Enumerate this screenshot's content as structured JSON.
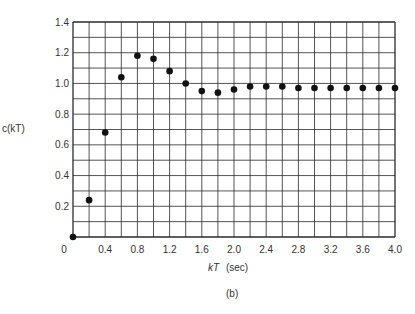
{
  "chart_data": {
    "type": "scatter",
    "title": "",
    "caption": "(b)",
    "xlabel": "kT (sec)",
    "xlabel_var": "kT",
    "xlabel_unit": "(sec)",
    "ylabel": "c(kT)",
    "xlim": [
      0,
      4.0
    ],
    "ylim": [
      0,
      1.4
    ],
    "grid": true,
    "grid_x_step": 0.2,
    "grid_y_step": 0.1,
    "x_ticks": [
      {
        "value": 0,
        "label": "0"
      },
      {
        "value": 0.4,
        "label": "0.4"
      },
      {
        "value": 0.8,
        "label": "0.8"
      },
      {
        "value": 1.2,
        "label": "1.2"
      },
      {
        "value": 1.6,
        "label": "1.6"
      },
      {
        "value": 2.0,
        "label": "2.0"
      },
      {
        "value": 2.4,
        "label": "2.4"
      },
      {
        "value": 2.8,
        "label": "2.8"
      },
      {
        "value": 3.2,
        "label": "3.2"
      },
      {
        "value": 3.6,
        "label": "3.6"
      },
      {
        "value": 4.0,
        "label": "4.0"
      }
    ],
    "y_ticks": [
      {
        "value": 0.2,
        "label": "0.2"
      },
      {
        "value": 0.4,
        "label": "0.4"
      },
      {
        "value": 0.6,
        "label": "0.6"
      },
      {
        "value": 0.8,
        "label": "0.8"
      },
      {
        "value": 1.0,
        "label": "1.0"
      },
      {
        "value": 1.2,
        "label": "1.2"
      },
      {
        "value": 1.4,
        "label": "1.4"
      }
    ],
    "series": [
      {
        "name": "c(kT)",
        "x": [
          0,
          0.2,
          0.4,
          0.6,
          0.8,
          1.0,
          1.2,
          1.4,
          1.6,
          1.8,
          2.0,
          2.2,
          2.4,
          2.6,
          2.8,
          3.0,
          3.2,
          3.4,
          3.6,
          3.8,
          4.0
        ],
        "values": [
          0,
          0.24,
          0.68,
          1.04,
          1.18,
          1.16,
          1.08,
          1.0,
          0.95,
          0.94,
          0.96,
          0.98,
          0.98,
          0.98,
          0.97,
          0.97,
          0.97,
          0.97,
          0.97,
          0.97,
          0.97
        ]
      }
    ]
  },
  "colors": {
    "grid": "#2a2a2a",
    "marker": "#111111",
    "text": "#333333"
  }
}
